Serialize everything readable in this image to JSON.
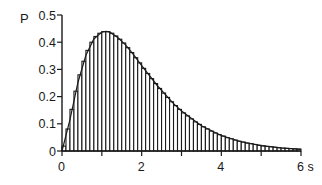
{
  "chart_data": {
    "type": "bar",
    "title": "",
    "xlabel": "s",
    "ylabel": "P",
    "xlim": [
      0,
      6
    ],
    "ylim": [
      0,
      0.5
    ],
    "grid": false,
    "legend": null,
    "x_ticks": [
      0,
      1,
      2,
      3,
      4,
      5,
      6
    ],
    "x_tick_labels": [
      "0",
      "",
      "2",
      "",
      "4",
      "",
      "6 s"
    ],
    "y_ticks": [
      0,
      0.1,
      0.2,
      0.3,
      0.4,
      0.5
    ],
    "y_tick_labels": [
      "0",
      "0.1",
      "0.2",
      "0.3",
      "0.4",
      "0.5"
    ],
    "bin_width": 0.1,
    "categories": [
      0.05,
      0.15,
      0.25,
      0.35,
      0.45,
      0.55,
      0.65,
      0.75,
      0.85,
      0.95,
      1.05,
      1.15,
      1.25,
      1.35,
      1.45,
      1.55,
      1.65,
      1.75,
      1.85,
      1.95,
      2.05,
      2.15,
      2.25,
      2.35,
      2.45,
      2.55,
      2.65,
      2.75,
      2.85,
      2.95,
      3.05,
      3.15,
      3.25,
      3.35,
      3.45,
      3.55,
      3.65,
      3.75,
      3.85,
      3.95,
      4.05,
      4.15,
      4.25,
      4.35,
      4.45,
      4.55,
      4.65,
      4.75,
      4.85,
      4.95,
      5.05,
      5.15,
      5.25,
      5.35,
      5.45,
      5.55,
      5.65,
      5.75,
      5.85,
      5.95
    ],
    "series": [
      {
        "name": "histogram",
        "values": [
          0.018,
          0.081,
          0.153,
          0.22,
          0.28,
          0.33,
          0.37,
          0.4,
          0.421,
          0.433,
          0.439,
          0.439,
          0.433,
          0.423,
          0.411,
          0.397,
          0.38,
          0.362,
          0.343,
          0.324,
          0.304,
          0.285,
          0.266,
          0.248,
          0.23,
          0.213,
          0.197,
          0.181,
          0.167,
          0.153,
          0.14,
          0.129,
          0.118,
          0.107,
          0.098,
          0.089,
          0.081,
          0.073,
          0.066,
          0.06,
          0.055,
          0.049,
          0.045,
          0.04,
          0.036,
          0.033,
          0.029,
          0.027,
          0.024,
          0.021,
          0.019,
          0.017,
          0.016,
          0.014,
          0.012,
          0.011,
          0.01,
          0.009,
          0.008,
          0.007
        ]
      },
      {
        "name": "fitted-curve",
        "type": "line",
        "x": [
          0,
          0.2,
          0.4,
          0.6,
          0.8,
          1.0,
          1.1,
          1.2,
          1.4,
          1.6,
          1.8,
          2.0,
          2.4,
          2.8,
          3.0,
          3.5,
          4.0,
          4.5,
          5.0,
          5.5,
          6.0
        ],
        "values": [
          0,
          0.115,
          0.252,
          0.352,
          0.412,
          0.437,
          0.44,
          0.437,
          0.417,
          0.389,
          0.353,
          0.314,
          0.239,
          0.174,
          0.147,
          0.093,
          0.057,
          0.034,
          0.02,
          0.011,
          0.006
        ]
      }
    ]
  },
  "labels": {
    "y_axis": "P",
    "x_axis_unit": "s"
  }
}
